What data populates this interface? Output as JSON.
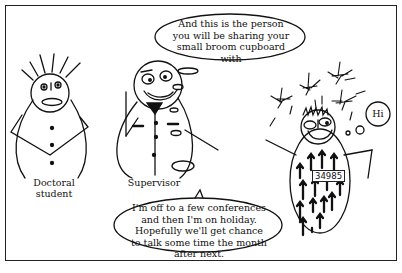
{
  "panel": {
    "characters": {
      "doctoral_student": {
        "label": "Doctoral student"
      },
      "supervisor": {
        "label": "Supervisor"
      },
      "new_student": {
        "badge_number": "34985"
      }
    },
    "speech": {
      "top_bubble": "And this is the person you will be sharing your small broom cupboard with",
      "hi_bubble": "Hi",
      "bottom_bubble": "I'm off to a few conferences and then I'm on holiday. Hopefully we'll get chance to talk some time the month after next."
    }
  }
}
